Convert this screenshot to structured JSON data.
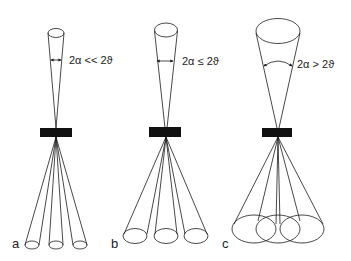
{
  "panels": [
    {
      "id": "a",
      "label": "a",
      "angle_relation": "2α << 2ϑ",
      "color": "#1a1a1a"
    },
    {
      "id": "b",
      "label": "b",
      "angle_relation": "2α ≤ 2ϑ",
      "color": "#1a1a1a"
    },
    {
      "id": "c",
      "label": "c",
      "angle_relation": "2α > 2ϑ",
      "color": "#1a1a1a"
    }
  ],
  "colors": {
    "background": "#ffffff",
    "line": "#1a1a1a",
    "sample": "#111111"
  }
}
